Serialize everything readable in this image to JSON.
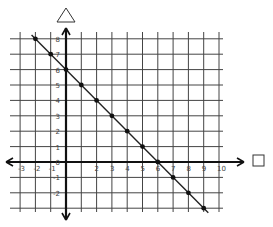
{
  "chart_data": {
    "type": "line",
    "title": "",
    "xlabel": "□",
    "ylabel": "△",
    "x_axis_label_shape": "square",
    "y_axis_label_shape": "triangle",
    "xlim": [
      -3,
      10
    ],
    "ylim": [
      -3,
      8
    ],
    "grid": true,
    "legend": null,
    "x_tick_labels": [
      "-3",
      "-2",
      "-1",
      "0",
      "1",
      "2",
      "3",
      "4",
      "5",
      "6",
      "7",
      "8",
      "9",
      "10"
    ],
    "y_tick_labels": [
      "-2",
      "-1",
      "0",
      "1",
      "2",
      "3",
      "4",
      "5",
      "6",
      "7",
      "8"
    ],
    "series": [
      {
        "name": "line",
        "equation": "y = -x + 6",
        "x": [
          -2,
          -1,
          0,
          1,
          2,
          3,
          4,
          5,
          6,
          7,
          8,
          9
        ],
        "y": [
          8,
          7,
          6,
          5,
          4,
          3,
          2,
          1,
          0,
          -1,
          -2,
          -3
        ]
      }
    ]
  },
  "labels": {
    "x_axis_shape": "square-icon",
    "y_axis_shape": "triangle-icon"
  }
}
